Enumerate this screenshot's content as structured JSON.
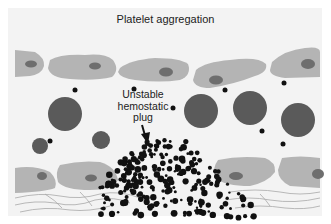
{
  "figure": {
    "title": "Platelet aggregation",
    "annotation": {
      "lines": [
        "Unstable",
        "hemostatic",
        "plug"
      ],
      "arrow_target": "platelet-aggregate"
    },
    "colors": {
      "background": "#f3f3f3",
      "endothelial_cell": "#b4b4b4",
      "nucleus": "#6e6e6e",
      "red_blood_cell": "#5a5a5a",
      "platelet": "#111111",
      "collagen_fiber": "#a8a8a8"
    },
    "elements": {
      "endothelial_cells_top": 5,
      "endothelial_cells_bottom": 4,
      "red_blood_cells": 8,
      "subendothelial_fibers": "collagen lines"
    }
  }
}
